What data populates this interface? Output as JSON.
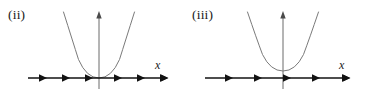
{
  "figure": {
    "type": "phase-line-diagram-pair",
    "background_color": "#ffffff",
    "width": 365,
    "height": 105,
    "curve_color": "#7a7a7a",
    "axis_color": "#6b6b6b",
    "phase_line_color": "#121212",
    "text_color": "#1a1a1a"
  },
  "panels": [
    {
      "id": "ii",
      "label": "(ii)",
      "x_axis_label": "x",
      "curve": {
        "type": "parabola",
        "opens": "up",
        "vertex": {
          "x": 0,
          "y": 0
        },
        "vertex_touches_axis": true,
        "real_roots": 1,
        "root_multiplicity": 2
      },
      "phase_line": {
        "arrow_count": 6,
        "all_directions": "right",
        "arrows": [
          {
            "index": 1,
            "direction": "right",
            "side": "negative"
          },
          {
            "index": 2,
            "direction": "right",
            "side": "negative"
          },
          {
            "index": 3,
            "direction": "right",
            "side": "negative"
          },
          {
            "index": 4,
            "direction": "right",
            "side": "positive"
          },
          {
            "index": 5,
            "direction": "right",
            "side": "positive"
          },
          {
            "index": 6,
            "direction": "right",
            "side": "positive"
          }
        ],
        "equilibrium_points": [
          0
        ],
        "terminal_arrowhead": true
      },
      "y_axis": {
        "arrowhead_top": true
      }
    },
    {
      "id": "iii",
      "label": "(iii)",
      "x_axis_label": "x",
      "curve": {
        "type": "parabola",
        "opens": "up",
        "vertex": {
          "x": 0,
          "y": 0.18
        },
        "vertex_touches_axis": false,
        "real_roots": 0,
        "root_multiplicity": 0
      },
      "phase_line": {
        "arrow_count": 5,
        "all_directions": "right",
        "arrows": [
          {
            "index": 1,
            "direction": "right",
            "side": "negative"
          },
          {
            "index": 2,
            "direction": "right",
            "side": "negative"
          },
          {
            "index": 3,
            "direction": "right",
            "side": "origin"
          },
          {
            "index": 4,
            "direction": "right",
            "side": "positive"
          },
          {
            "index": 5,
            "direction": "right",
            "side": "positive"
          }
        ],
        "equilibrium_points": [],
        "terminal_arrowhead": true
      },
      "y_axis": {
        "arrowhead_top": true
      }
    }
  ]
}
